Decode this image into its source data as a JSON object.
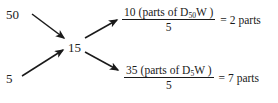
{
  "diagram": {
    "nodes": {
      "top_left": "50",
      "bottom_left": "5",
      "center": "15"
    },
    "branches": [
      {
        "id": "top",
        "numerator_value": "10",
        "numerator_text_open": "(parts of D",
        "numerator_subscript": "50",
        "numerator_text_close": "W )",
        "denominator": "5",
        "equals": "=",
        "result": "2 parts"
      },
      {
        "id": "bottom",
        "numerator_value": "35",
        "numerator_text_open": "(parts of D",
        "numerator_subscript": "5",
        "numerator_text_close": "W )",
        "denominator": "5",
        "equals": "=",
        "result": "7 parts"
      }
    ],
    "arrows": [
      {
        "name": "arrow-50-to-15",
        "from": "50",
        "to": "15"
      },
      {
        "name": "arrow-5-to-15",
        "from": "5",
        "to": "15"
      },
      {
        "name": "arrow-15-to-top-fraction",
        "from": "15",
        "to": "10 (parts of D50W)"
      },
      {
        "name": "arrow-15-to-bottom-fraction",
        "from": "15",
        "to": "35 (parts of D5W)"
      }
    ],
    "colors": {
      "ink": "#1a1a1a",
      "background": "#ffffff"
    }
  }
}
